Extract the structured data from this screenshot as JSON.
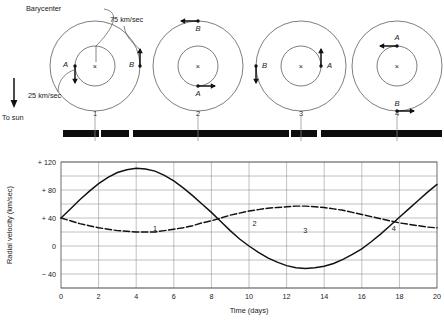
{
  "figure": {
    "title_labels": {
      "barycenter": "Barycenter",
      "to_sun": "To sun",
      "speed_a": "25 km/sec",
      "speed_b": "75 km/sec",
      "star_a": "A",
      "star_b": "B",
      "center_marker": "×"
    },
    "phases": [
      "1",
      "2",
      "3",
      "4"
    ]
  },
  "orbit_panels": [
    {
      "phase": "1",
      "center": {
        "x": 95,
        "y": 66
      },
      "outer_r": 45,
      "inner_r": 20,
      "star_a": {
        "x": 75,
        "y": 66,
        "label": "A",
        "arrow": "down",
        "speed": "25 km/sec"
      },
      "star_b": {
        "x": 140,
        "y": 66,
        "label": "B",
        "arrow": "up",
        "speed": "75 km/sec"
      }
    },
    {
      "phase": "2",
      "center": {
        "x": 198,
        "y": 66
      },
      "outer_r": 45,
      "inner_r": 20,
      "star_a": {
        "x": 198,
        "y": 86,
        "label": "A",
        "arrow": "right",
        "speed": "25 km/sec"
      },
      "star_b": {
        "x": 198,
        "y": 21,
        "label": "B",
        "arrow": "left",
        "speed": "75 km/sec"
      }
    },
    {
      "phase": "3",
      "center": {
        "x": 301,
        "y": 66
      },
      "outer_r": 45,
      "inner_r": 20,
      "star_a": {
        "x": 321,
        "y": 66,
        "label": "A",
        "arrow": "up",
        "speed": "25 km/sec"
      },
      "star_b": {
        "x": 256,
        "y": 66,
        "label": "B",
        "arrow": "down",
        "speed": "75 km/sec"
      }
    },
    {
      "phase": "4",
      "center": {
        "x": 397,
        "y": 66
      },
      "outer_r": 45,
      "inner_r": 20,
      "star_a": {
        "x": 397,
        "y": 46,
        "label": "A",
        "arrow": "left",
        "speed": "25 km/sec"
      },
      "star_b": {
        "x": 397,
        "y": 111,
        "label": "B",
        "arrow": "right",
        "speed": "75 km/sec"
      }
    }
  ],
  "spectra": [
    {
      "phase": "1",
      "state": "split",
      "segments": [
        [
          63,
          36
        ],
        [
          101,
          28
        ],
        [
          133,
          36
        ]
      ],
      "y": 130,
      "h": 7
    },
    {
      "phase": "2",
      "state": "merged",
      "segments": [
        [
          151,
          108
        ]
      ],
      "y": 130,
      "h": 7
    },
    {
      "phase": "3",
      "state": "split",
      "segments": [
        [
          253,
          36
        ],
        [
          291,
          26
        ],
        [
          321,
          42
        ]
      ],
      "y": 130,
      "h": 7
    },
    {
      "phase": "4",
      "state": "merged",
      "segments": [
        [
          358,
          84
        ]
      ],
      "y": 130,
      "h": 7
    }
  ],
  "chart_data": {
    "type": "line",
    "title": "",
    "xlabel": "Time (days)",
    "ylabel": "Radial velocity  (km/sec)",
    "xlim": [
      0,
      20
    ],
    "ylim": [
      -60,
      120
    ],
    "xticks": [
      0,
      2,
      4,
      6,
      8,
      10,
      12,
      14,
      16,
      18,
      20
    ],
    "yticks": [
      -40,
      0,
      40,
      80,
      120
    ],
    "ytick_labels": [
      "− 40",
      "0",
      "+ 40",
      "+ 80",
      "+ 120"
    ],
    "gridlines_y": [
      -60,
      -40,
      -20,
      0,
      20,
      40,
      60,
      80,
      100,
      120
    ],
    "grid": true,
    "legend": "none",
    "phase_markers": [
      {
        "label": "1",
        "x": 5.0,
        "y": 22
      },
      {
        "label": "2",
        "x": 10.3,
        "y": 28
      },
      {
        "label": "3",
        "x": 13.0,
        "y": 18
      },
      {
        "label": "4",
        "x": 17.7,
        "y": 22
      }
    ],
    "series": [
      {
        "name": "Star B (75 km/sec)",
        "style": "solid",
        "x": [
          0,
          0.5,
          1,
          1.5,
          2,
          2.5,
          3,
          3.5,
          4,
          4.5,
          5,
          5.5,
          6,
          6.5,
          7,
          7.5,
          8,
          8.5,
          9,
          9.5,
          10,
          10.5,
          11,
          11.5,
          12,
          12.5,
          13,
          13.5,
          14,
          14.5,
          15,
          15.5,
          16,
          16.5,
          17,
          17.5,
          18,
          18.5,
          19,
          19.5,
          20
        ],
        "y": [
          40,
          53,
          66,
          78,
          89,
          98,
          105,
          109,
          111,
          110,
          107,
          101,
          93,
          83,
          72,
          60,
          48,
          35,
          22,
          10,
          0,
          -9,
          -17,
          -23,
          -28,
          -31,
          -32,
          -31,
          -29,
          -25,
          -19,
          -12,
          -4,
          6,
          17,
          29,
          41,
          53,
          65,
          77,
          88
        ]
      },
      {
        "name": "Star A (25 km/sec)",
        "style": "dashed",
        "x": [
          0,
          0.5,
          1,
          1.5,
          2,
          2.5,
          3,
          3.5,
          4,
          4.5,
          5,
          5.5,
          6,
          6.5,
          7,
          7.5,
          8,
          8.5,
          9,
          9.5,
          10,
          10.5,
          11,
          11.5,
          12,
          12.5,
          13,
          13.5,
          14,
          14.5,
          15,
          15.5,
          16,
          16.5,
          17,
          17.5,
          18,
          18.5,
          19,
          19.5,
          20
        ],
        "y": [
          40,
          36,
          32,
          29,
          26,
          24,
          22,
          21,
          20,
          20,
          20,
          22,
          24,
          26,
          29,
          33,
          36,
          40,
          44,
          47,
          50,
          52,
          54,
          55,
          56,
          57,
          57,
          56,
          55,
          53,
          51,
          48,
          45,
          42,
          39,
          36,
          33,
          31,
          29,
          27,
          26
        ]
      }
    ]
  }
}
